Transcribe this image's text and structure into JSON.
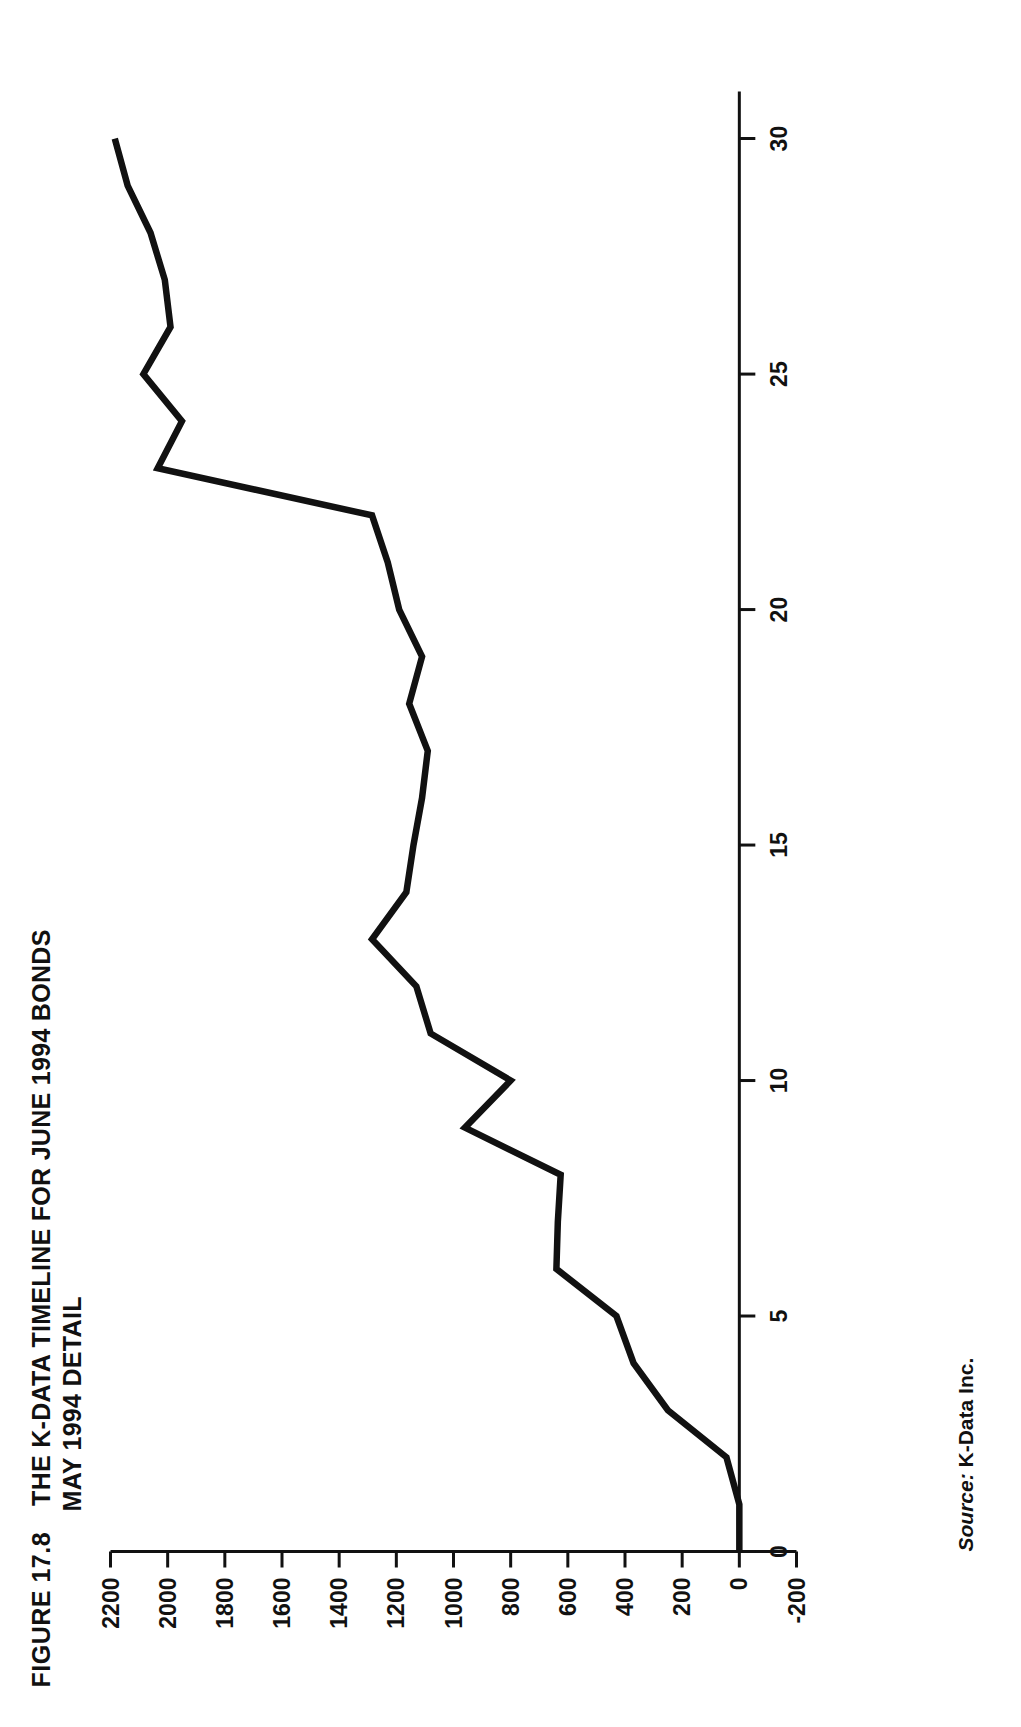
{
  "figure": {
    "label_small_caps_lead": "F",
    "label_rest": "IGURE",
    "label_number": "17.8",
    "title_lead": "T",
    "title_rest": "HE K-DATA TIMELINE FOR JUNE 1994 BONDS",
    "subtitle": "MAY 1994 DETAIL",
    "full_label": "FIGURE 17.8",
    "full_title": "THE K-DATA TIMELINE FOR JUNE 1994 BONDS",
    "orientation": "rotated-90-ccw"
  },
  "source": {
    "label": "Source:",
    "value": "K-Data Inc."
  },
  "colors": {
    "ink": "#111111",
    "paper": "#ffffff",
    "series": "#111111"
  },
  "chart_data": {
    "type": "line",
    "title": "THE K-DATA TIMELINE FOR JUNE 1994 BONDS",
    "subtitle": "MAY 1994 DETAIL",
    "xlabel": "",
    "ylabel": "",
    "xlim": [
      0,
      31
    ],
    "ylim": [
      -200,
      2200
    ],
    "grid": false,
    "legend": null,
    "xticks": [
      0,
      5,
      10,
      15,
      20,
      25,
      30
    ],
    "xticklabels": [
      "0",
      "5",
      "10",
      "15",
      "20",
      "25",
      "30"
    ],
    "yticks": [
      -200,
      0,
      200,
      400,
      600,
      800,
      1000,
      1200,
      1400,
      1600,
      1800,
      2000,
      2200
    ],
    "yticklabels": [
      "-200",
      "0",
      "200",
      "400",
      "600",
      "800",
      "1000",
      "1200",
      "1400",
      "1600",
      "1800",
      "2000",
      "2200"
    ],
    "series": [
      {
        "name": "K-Data timeline",
        "x": [
          0,
          1,
          2,
          3,
          4,
          5,
          6,
          7,
          8,
          9,
          10,
          11,
          12,
          13,
          14,
          15,
          16,
          17,
          18,
          19,
          20,
          21,
          22,
          23,
          24,
          25,
          26,
          27,
          28,
          29,
          30
        ],
        "values": [
          0,
          0,
          45,
          250,
          370,
          430,
          640,
          635,
          625,
          960,
          800,
          1080,
          1130,
          1285,
          1165,
          1140,
          1110,
          1090,
          1155,
          1110,
          1190,
          1230,
          1285,
          2035,
          1950,
          2085,
          1990,
          2010,
          2060,
          2140,
          2185
        ]
      }
    ]
  }
}
